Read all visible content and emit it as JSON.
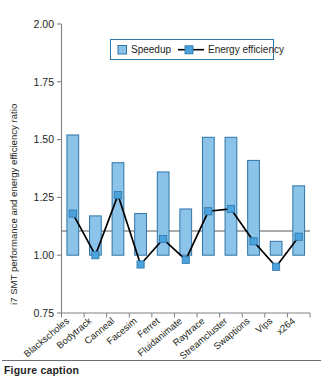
{
  "chart_data": {
    "type": "bar",
    "title": "",
    "xlabel": "",
    "ylabel": "i7 SMT performance and energy efficiency ratio",
    "ylim": [
      0.75,
      2.0
    ],
    "yticks": [
      "0.75",
      "1.00",
      "1.25",
      "1.50",
      "1.75",
      "2.00"
    ],
    "ytick_values": [
      0.75,
      1.0,
      1.25,
      1.5,
      1.75,
      2.0
    ],
    "grid": false,
    "baseline": 1.0,
    "legend_position": "top-center",
    "categories": [
      "Blackscholes",
      "Bodytrack",
      "Canneal",
      "Facesim",
      "Ferret",
      "Fluidanimate",
      "Raytrace",
      "Streamcluster",
      "Swaptions",
      "Vips",
      "x264"
    ],
    "series": [
      {
        "name": "Speedup",
        "kind": "bar",
        "color": "#8cc3e8",
        "edge_color": "#2e75a8",
        "values": [
          1.52,
          1.17,
          1.4,
          1.18,
          1.36,
          1.2,
          1.51,
          1.51,
          1.41,
          1.06,
          1.3
        ]
      },
      {
        "name": "Energy efficiency",
        "kind": "line",
        "color": "#000000",
        "marker_color": "#4ba3dd",
        "values": [
          1.18,
          1.0,
          1.26,
          0.96,
          1.07,
          0.98,
          1.19,
          1.2,
          1.06,
          0.95,
          1.08
        ]
      }
    ]
  },
  "legend": {
    "items": [
      {
        "label": "Speedup",
        "marker": "square-swatch"
      },
      {
        "label": "Energy efficiency",
        "marker": "line-with-square-marker"
      }
    ]
  },
  "caption": {
    "text": "Figure caption"
  },
  "colors": {
    "bar_fill": "#8cc3e8",
    "bar_edge": "#2e75a8",
    "line": "#000000",
    "marker": "#4ba3dd",
    "axis": "#808285",
    "text": "#231f20"
  }
}
